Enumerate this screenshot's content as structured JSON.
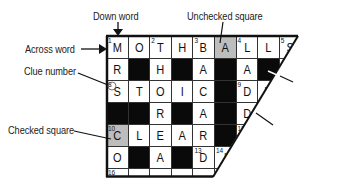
{
  "callouts": {
    "down_word": "Down word",
    "across_word": "Across word",
    "clue_number": "Clue number",
    "checked_square": "Checked square",
    "unchecked_square": "Unchecked square",
    "black_square": "Black square",
    "white_square": "White square"
  },
  "colors": {
    "black_square": "#0a0a0a",
    "shaded_square": "#bdbdbd",
    "white_square": "#ffffff",
    "lines": "#111111"
  },
  "grid": {
    "rows": [
      [
        {
          "type": "white",
          "num": "1",
          "letter": "M"
        },
        {
          "type": "white",
          "num": "",
          "letter": "O"
        },
        {
          "type": "white",
          "num": "2",
          "letter": "T"
        },
        {
          "type": "white",
          "num": "",
          "letter": "H"
        },
        {
          "type": "white",
          "num": "3",
          "letter": "B"
        },
        {
          "type": "gray",
          "num": "",
          "letter": "A"
        },
        {
          "type": "white",
          "num": "4",
          "letter": "L"
        },
        {
          "type": "white",
          "num": "",
          "letter": "L"
        },
        {
          "type": "white",
          "num": "5",
          "letter": "S"
        }
      ],
      [
        {
          "type": "white",
          "num": "",
          "letter": "R"
        },
        {
          "type": "black",
          "num": "",
          "letter": ""
        },
        {
          "type": "white",
          "num": "",
          "letter": "H"
        },
        {
          "type": "black",
          "num": "",
          "letter": ""
        },
        {
          "type": "white",
          "num": "",
          "letter": "A"
        },
        {
          "type": "black",
          "num": "",
          "letter": ""
        },
        {
          "type": "white",
          "num": "",
          "letter": "A"
        },
        {
          "type": "black",
          "num": "",
          "letter": ""
        },
        {
          "type": "white",
          "num": "",
          "letter": ""
        }
      ],
      [
        {
          "type": "white",
          "num": "8",
          "letter": "S"
        },
        {
          "type": "white",
          "num": "",
          "letter": "T"
        },
        {
          "type": "white",
          "num": "",
          "letter": "O"
        },
        {
          "type": "white",
          "num": "",
          "letter": "I"
        },
        {
          "type": "white",
          "num": "",
          "letter": "C"
        },
        {
          "type": "black",
          "num": "",
          "letter": ""
        },
        {
          "type": "white",
          "num": "9",
          "letter": "D"
        },
        {
          "type": "white",
          "num": "",
          "letter": "R"
        },
        {
          "type": "white",
          "num": "",
          "letter": ""
        }
      ],
      [
        {
          "type": "black",
          "num": "",
          "letter": ""
        },
        {
          "type": "black",
          "num": "",
          "letter": ""
        },
        {
          "type": "white",
          "num": "",
          "letter": "R"
        },
        {
          "type": "black",
          "num": "",
          "letter": ""
        },
        {
          "type": "white",
          "num": "",
          "letter": "A"
        },
        {
          "type": "black",
          "num": "",
          "letter": ""
        },
        {
          "type": "white",
          "num": "",
          "letter": "D"
        },
        {
          "type": "black",
          "num": "",
          "letter": ""
        },
        {
          "type": "white",
          "num": "",
          "letter": ""
        }
      ],
      [
        {
          "type": "gray",
          "num": "10",
          "letter": "C"
        },
        {
          "type": "white",
          "num": "",
          "letter": "L"
        },
        {
          "type": "white",
          "num": "",
          "letter": "E"
        },
        {
          "type": "white",
          "num": "",
          "letter": "A"
        },
        {
          "type": "white",
          "num": "",
          "letter": "R"
        },
        {
          "type": "black",
          "num": "",
          "letter": ""
        },
        {
          "type": "white",
          "num": "11",
          "letter": "E"
        },
        {
          "type": "white",
          "num": "",
          "letter": ""
        },
        {
          "type": "white",
          "num": "",
          "letter": ""
        }
      ],
      [
        {
          "type": "white",
          "num": "",
          "letter": "O"
        },
        {
          "type": "black",
          "num": "",
          "letter": ""
        },
        {
          "type": "white",
          "num": "",
          "letter": "A"
        },
        {
          "type": "black",
          "num": "",
          "letter": ""
        },
        {
          "type": "white",
          "num": "13",
          "letter": "D"
        },
        {
          "type": "white",
          "num": "14",
          "letter": "I"
        },
        {
          "type": "white",
          "num": "",
          "letter": ""
        },
        {
          "type": "white",
          "num": "",
          "letter": ""
        },
        {
          "type": "white",
          "num": "",
          "letter": ""
        }
      ],
      [
        {
          "type": "white",
          "num": "16",
          "letter": ""
        },
        {
          "type": "white",
          "num": "",
          "letter": ""
        },
        {
          "type": "white",
          "num": "",
          "letter": ""
        },
        {
          "type": "white",
          "num": "",
          "letter": ""
        },
        {
          "type": "white",
          "num": "",
          "letter": ""
        },
        {
          "type": "white",
          "num": "",
          "letter": ""
        },
        {
          "type": "white",
          "num": "",
          "letter": ""
        },
        {
          "type": "white",
          "num": "",
          "letter": ""
        },
        {
          "type": "white",
          "num": "",
          "letter": ""
        }
      ]
    ]
  }
}
